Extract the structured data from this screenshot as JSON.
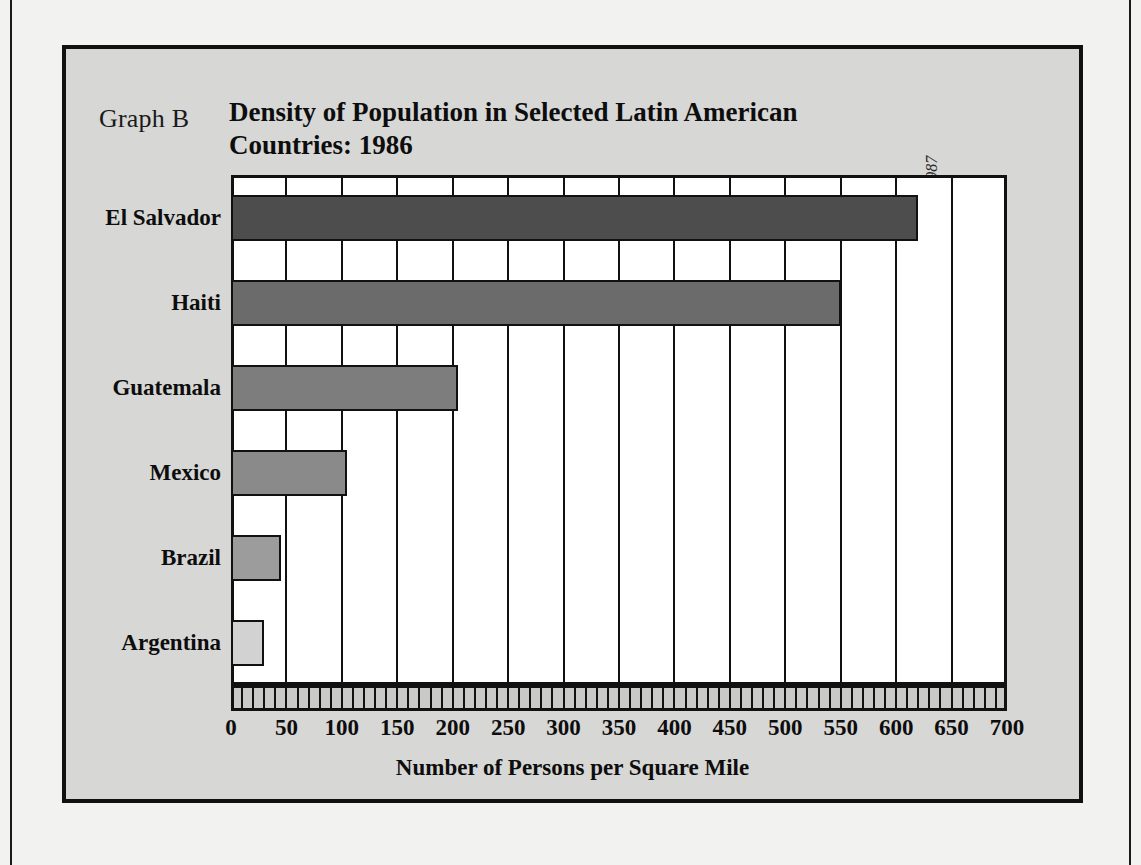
{
  "figure": {
    "graph_label": "Graph B",
    "title": "Density of Population in Selected Latin American Countries: 1986",
    "source_prefix": "Source: ",
    "source_italic": "Information Please Almanac, 1987"
  },
  "chart_data": {
    "type": "bar",
    "orientation": "horizontal",
    "title": "Density of Population in Selected Latin American Countries: 1986",
    "xlabel": "Number of Persons per Square Mile",
    "ylabel": "",
    "categories": [
      "El Salvador",
      "Haiti",
      "Guatemala",
      "Mexico",
      "Brazil",
      "Argentina"
    ],
    "values": [
      620,
      550,
      205,
      105,
      45,
      30
    ],
    "xlim": [
      0,
      700
    ],
    "xticks": [
      0,
      50,
      100,
      150,
      200,
      250,
      300,
      350,
      400,
      450,
      500,
      550,
      600,
      650,
      700
    ],
    "xtick_labels": [
      "0",
      "50",
      "100",
      "150",
      "200",
      "250",
      "300",
      "350",
      "400",
      "450",
      "500",
      "550",
      "600",
      "650",
      "700"
    ],
    "minor_tick_step": 10,
    "grid": true,
    "grid_axis": "x",
    "legend": false,
    "bar_colors": [
      "#4d4d4d",
      "#6b6b6b",
      "#7d7d7d",
      "#8a8a8a",
      "#9c9c9c",
      "#d2d2d2"
    ],
    "bar_edge_color": "#111111",
    "plot_background": "#ffffff",
    "figure_background": "#d7d7d5"
  }
}
